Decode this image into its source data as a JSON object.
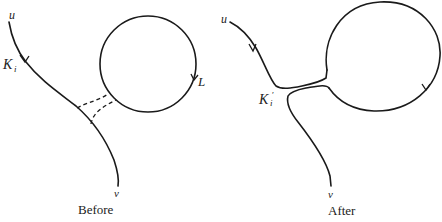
{
  "figure": {
    "panels": [
      {
        "id": "before",
        "caption": "Before",
        "labels": {
          "start": "u",
          "end": "v",
          "knot": "K",
          "knot_sub": "i",
          "loop": "L"
        }
      },
      {
        "id": "after",
        "caption": "After",
        "labels": {
          "start": "u",
          "end": "v",
          "knot": "K",
          "knot_sub": "i",
          "knot_prime": "′"
        }
      }
    ],
    "colors": {
      "stroke": "#1a1a1a",
      "background": "#ffffff"
    }
  }
}
